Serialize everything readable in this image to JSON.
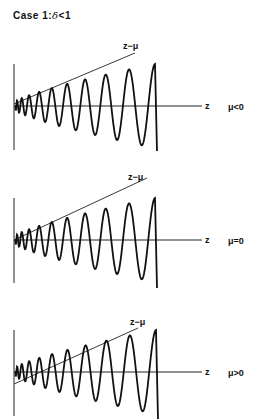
{
  "title": {
    "prefix": "Case  1:",
    "symbol": "δ",
    "suffix": "<1"
  },
  "panels": [
    {
      "id": "mu-negative",
      "axis_label": "z",
      "line_label": "z−μ",
      "condition": "μ<0",
      "mu_sign": "negative"
    },
    {
      "id": "mu-zero",
      "axis_label": "z",
      "line_label": "z−μ",
      "condition": "μ=0",
      "mu_sign": "zero"
    },
    {
      "id": "mu-positive",
      "axis_label": "z",
      "line_label": "z−μ",
      "condition": "μ>0",
      "mu_sign": "positive"
    }
  ],
  "chart_data": {
    "type": "line",
    "series": [
      {
        "name": "oscillation",
        "style": "thick solid"
      },
      {
        "name": "z−μ",
        "style": "thin straight line"
      }
    ],
    "panels": [
      {
        "condition": "μ<0",
        "line_intercept": "above origin"
      },
      {
        "condition": "μ=0",
        "line_intercept": "at origin"
      },
      {
        "condition": "μ>0",
        "line_intercept": "below origin"
      }
    ],
    "xlabel": "z",
    "grid": false
  }
}
